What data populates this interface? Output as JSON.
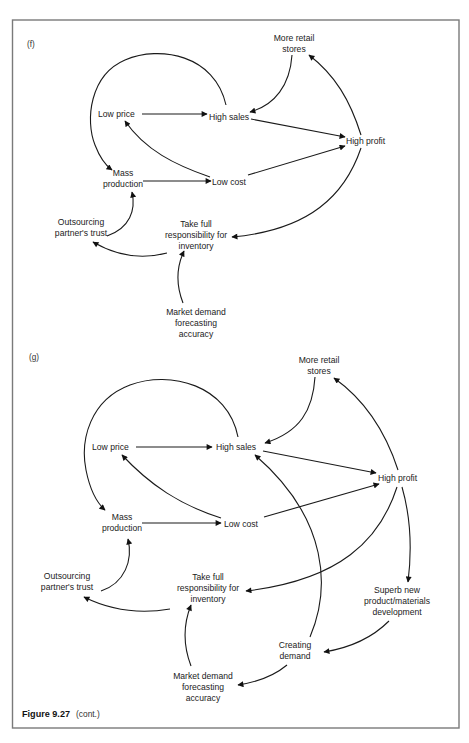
{
  "figure": {
    "caption_label": "Figure 9.27",
    "caption_suffix": "(cont.)",
    "frame_color": "#7a7a7a",
    "line_color": "#1a1a1a"
  },
  "panels": [
    {
      "id": "f",
      "label": "(f)",
      "label_pos": [
        27,
        47
      ],
      "nodes": [
        {
          "id": "more-retail-stores",
          "lines": [
            "More retail",
            "stores"
          ],
          "x": 294,
          "y": 41,
          "anchor": "middle"
        },
        {
          "id": "low-price",
          "lines": [
            "Low price"
          ],
          "x": 98,
          "y": 117,
          "anchor": "start"
        },
        {
          "id": "high-sales",
          "lines": [
            "High sales"
          ],
          "x": 209,
          "y": 120,
          "anchor": "start"
        },
        {
          "id": "high-profit",
          "lines": [
            "High profit"
          ],
          "x": 346,
          "y": 144,
          "anchor": "start"
        },
        {
          "id": "mass-production",
          "lines": [
            "Mass",
            "production"
          ],
          "x": 123,
          "y": 176,
          "anchor": "middle"
        },
        {
          "id": "low-cost",
          "lines": [
            "Low cost"
          ],
          "x": 212,
          "y": 185,
          "anchor": "start"
        },
        {
          "id": "outsourcing-partners-trust",
          "lines": [
            "Outsourcing",
            "partner's trust"
          ],
          "x": 81,
          "y": 225,
          "anchor": "middle"
        },
        {
          "id": "take-full-responsibility",
          "lines": [
            "Take full",
            "responsibility for",
            "inventory"
          ],
          "x": 196,
          "y": 227,
          "anchor": "middle"
        },
        {
          "id": "market-demand-forecasting",
          "lines": [
            "Market demand",
            "forecasting",
            "accuracy"
          ],
          "x": 196,
          "y": 315,
          "anchor": "middle"
        }
      ],
      "edges": [
        {
          "from": "low-price",
          "to": "high-sales",
          "d": "M142,114 L207,114"
        },
        {
          "from": "high-sales",
          "to": "mass-production",
          "d": "M226,105 C215,55 160,45 125,60 C90,75 85,120 95,145 C100,158 105,165 112,170"
        },
        {
          "from": "more-retail-stores",
          "to": "high-sales",
          "d": "M292,55 C290,85 275,105 250,112"
        },
        {
          "from": "high-sales",
          "to": "high-profit",
          "d": "M251,119 L345,137"
        },
        {
          "from": "low-cost",
          "to": "low-price",
          "d": "M210,177 C175,165 145,150 125,121"
        },
        {
          "from": "mass-production",
          "to": "low-cost",
          "d": "M143,181 L211,181"
        },
        {
          "from": "low-cost",
          "to": "high-profit",
          "d": "M248,175 L345,146"
        },
        {
          "from": "high-profit",
          "to": "more-retail-stores",
          "d": "M361,135 C350,100 335,75 309,55"
        },
        {
          "from": "high-profit",
          "to": "take-full-responsibility",
          "d": "M361,148 C345,195 310,230 232,237"
        },
        {
          "from": "outsourcing-partners-trust",
          "to": "mass-production",
          "d": "M107,236 C130,228 136,210 132,192"
        },
        {
          "from": "take-full-responsibility",
          "to": "outsourcing-partners-trust",
          "d": "M167,253 C140,260 115,255 93,242"
        },
        {
          "from": "market-demand-forecasting",
          "to": "take-full-responsibility",
          "d": "M183,303 C176,285 176,268 184,251"
        }
      ]
    },
    {
      "id": "g",
      "label": "(g)",
      "label_pos": [
        29,
        360
      ],
      "nodes": [
        {
          "id": "more-retail-stores",
          "lines": [
            "More retail",
            "stores"
          ],
          "x": 319,
          "y": 363,
          "anchor": "middle"
        },
        {
          "id": "low-price",
          "lines": [
            "Low price"
          ],
          "x": 92,
          "y": 450,
          "anchor": "start"
        },
        {
          "id": "high-sales",
          "lines": [
            "High sales"
          ],
          "x": 216,
          "y": 450,
          "anchor": "start"
        },
        {
          "id": "high-profit",
          "lines": [
            "High profit"
          ],
          "x": 378,
          "y": 481,
          "anchor": "start"
        },
        {
          "id": "mass-production",
          "lines": [
            "Mass",
            "production"
          ],
          "x": 122,
          "y": 520,
          "anchor": "middle"
        },
        {
          "id": "low-cost",
          "lines": [
            "Low cost"
          ],
          "x": 224,
          "y": 527,
          "anchor": "start"
        },
        {
          "id": "outsourcing-partners-trust",
          "lines": [
            "Outsourcing",
            "partner's trust"
          ],
          "x": 67,
          "y": 579,
          "anchor": "middle"
        },
        {
          "id": "take-full-responsibility",
          "lines": [
            "Take full",
            "responsibility for",
            "inventory"
          ],
          "x": 208,
          "y": 580,
          "anchor": "middle"
        },
        {
          "id": "superb-new-product-materials-development",
          "lines": [
            "Superb new",
            "product/materials",
            "development"
          ],
          "x": 397,
          "y": 593,
          "anchor": "middle"
        },
        {
          "id": "creating-demand",
          "lines": [
            "Creating",
            "demand"
          ],
          "x": 295,
          "y": 648,
          "anchor": "middle"
        },
        {
          "id": "market-demand-forecasting",
          "lines": [
            "Market demand",
            "forecasting",
            "accuracy"
          ],
          "x": 203,
          "y": 679,
          "anchor": "middle"
        }
      ],
      "edges": [
        {
          "from": "low-price",
          "to": "high-sales",
          "d": "M136,447 L212,447"
        },
        {
          "from": "high-sales",
          "to": "mass-production",
          "d": "M238,437 C228,385 170,370 130,385 C90,400 80,440 86,470 C90,490 96,502 105,510"
        },
        {
          "from": "more-retail-stores",
          "to": "high-sales",
          "d": "M315,377 C313,410 300,432 265,443"
        },
        {
          "from": "high-sales",
          "to": "high-profit",
          "d": "M263,451 L376,473"
        },
        {
          "from": "low-cost",
          "to": "low-price",
          "d": "M221,518 C180,505 150,485 122,455"
        },
        {
          "from": "mass-production",
          "to": "low-cost",
          "d": "M142,523 L221,523"
        },
        {
          "from": "low-cost",
          "to": "high-profit",
          "d": "M264,517 L379,484"
        },
        {
          "from": "creating-demand",
          "to": "high-sales",
          "d": "M310,637 C330,590 330,520 255,455"
        },
        {
          "from": "high-profit",
          "to": "more-retail-stores",
          "d": "M398,470 C385,430 365,400 334,378"
        },
        {
          "from": "high-profit",
          "to": "take-full-responsibility",
          "d": "M397,487 C380,540 340,580 246,591"
        },
        {
          "from": "high-profit",
          "to": "superb-new-product-materials-development",
          "d": "M402,487 C410,515 412,550 408,582"
        },
        {
          "from": "superb-new-product-materials-development",
          "to": "creating-demand",
          "d": "M389,621 C375,635 355,647 324,652"
        },
        {
          "from": "outsourcing-partners-trust",
          "to": "mass-production",
          "d": "M101,591 C125,583 133,560 128,539"
        },
        {
          "from": "take-full-responsibility",
          "to": "outsourcing-partners-trust",
          "d": "M170,609 C140,614 110,610 84,597"
        },
        {
          "from": "market-demand-forecasting",
          "to": "take-full-responsibility",
          "d": "M191,666 C183,645 183,625 191,605"
        },
        {
          "from": "creating-demand",
          "to": "market-demand-forecasting",
          "d": "M287,665 C275,675 258,682 238,685"
        }
      ]
    }
  ]
}
